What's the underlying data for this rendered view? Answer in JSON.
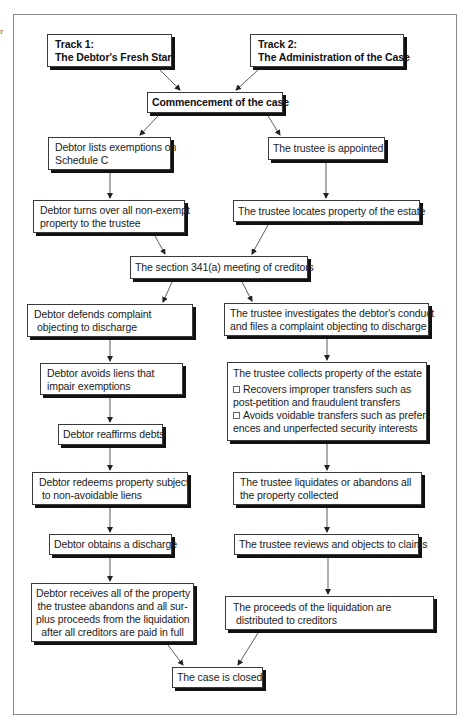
{
  "edge_mark": "r",
  "diagram": {
    "tracks": {
      "track1": {
        "title": "Track 1:",
        "subtitle": "The Debtor's Fresh Start"
      },
      "track2": {
        "title": "Track 2:",
        "subtitle": "The Administration of the Case"
      }
    },
    "commencement": "Commencement of the case",
    "debtor_track": {
      "lists_exemptions": [
        "Debtor lists exemptions on",
        "Schedule C"
      ],
      "turns_over": [
        "Debtor turns over all non-exempt",
        "property to the trustee"
      ],
      "defends_complaint": [
        "Debtor defends complaint",
        "objecting to discharge"
      ],
      "avoids_liens": [
        "Debtor avoids liens that",
        "impair exemptions"
      ],
      "reaffirms": "Debtor reaffirms debts",
      "redeems": [
        "Debtor redeems property subject",
        "to non-avoidable liens"
      ],
      "obtains_discharge": "Debtor obtains a discharge",
      "receives_property": [
        "Debtor receives all of the property",
        "the trustee abandons and all sur-",
        "plus proceeds from the liquidation",
        "after all creditors are paid in full"
      ]
    },
    "meeting": "The section 341(a) meeting of creditors",
    "trustee_track": {
      "appointed": "The trustee is appointed",
      "locates": "The trustee locates property of the estate",
      "investigates": [
        "The trustee investigates the debtor's conduct",
        "and files a complaint objecting to discharge"
      ],
      "collects": {
        "heading": "The trustee collects property of the estate",
        "bullets": [
          {
            "icon": "checkbox-square-icon",
            "lines": [
              "Recovers improper transfers such as",
              "post-petition and fraudulent transfers"
            ]
          },
          {
            "icon": "checkbox-square-icon",
            "lines": [
              "Avoids voidable transfers such as prefer-",
              "ences and unperfected security interests"
            ]
          }
        ]
      },
      "liquidates": [
        "The trustee liquidates or abandons all",
        "the property collected"
      ],
      "reviews_claims": "The trustee reviews and objects to claims",
      "proceeds_distributed": [
        "The proceeds of the liquidation are",
        "distributed to creditors"
      ]
    },
    "closed": "The case is closed"
  }
}
